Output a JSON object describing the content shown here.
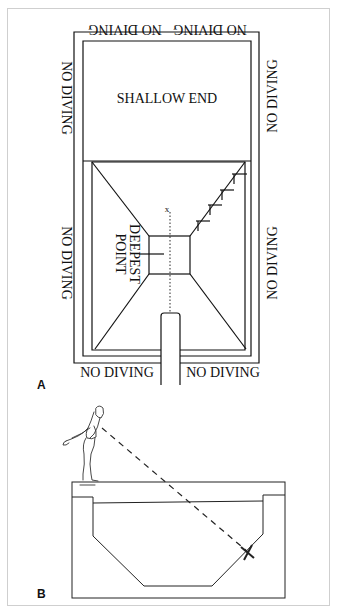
{
  "figure": {
    "panel_a": {
      "label": "A",
      "top_left_text": "NO DIVING",
      "top_right_text": "NO DIVING",
      "left_upper_text": "NO DIVING",
      "left_lower_text": "NO DIVING",
      "right_upper_text": "NO DIVING",
      "right_lower_text": "NO DIVING",
      "bottom_left_text": "NO DIVING",
      "bottom_right_text": "NO DIVING",
      "shallow_label": "SHALLOW END",
      "deepest_label_line1": "DEEPEST",
      "deepest_label_line2": "POINT",
      "target_mark": "x"
    },
    "panel_b": {
      "label": "B",
      "target_mark": "X"
    }
  }
}
